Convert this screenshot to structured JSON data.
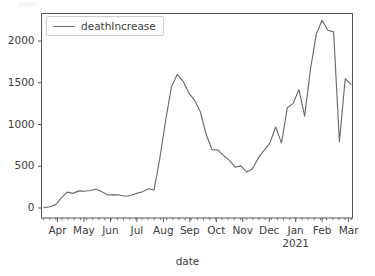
{
  "figure": {
    "background_color": "#ffffff",
    "line_color": "#6b6b6b",
    "axis_color": "#555555",
    "text_color": "#3c3c3c"
  },
  "legend": {
    "label": "deathIncrease",
    "position": "upper left",
    "frame": true
  },
  "axes": {
    "xlabel": "date",
    "ylabel": "",
    "year_annotation": "2021"
  },
  "chart_data": {
    "type": "line",
    "title": "",
    "xlabel": "date",
    "ylabel": "",
    "ylim": [
      -120,
      2330
    ],
    "yticks": [
      0,
      500,
      1000,
      1500,
      2000
    ],
    "ytick_labels": [
      "0",
      "500",
      "1000",
      "1500",
      "2000"
    ],
    "xtick_labels": [
      "Apr",
      "May",
      "Jun",
      "Jul",
      "Aug",
      "Sep",
      "Oct",
      "Nov",
      "Dec",
      "Jan",
      "Feb",
      "Mar"
    ],
    "xtick_sublabels": {
      "Jan": "2021"
    },
    "grid": false,
    "legend_position": "upper left",
    "series": [
      {
        "name": "deathIncrease",
        "color": "#6b6b6b",
        "x": [
          "2020-03-08",
          "2020-03-15",
          "2020-03-22",
          "2020-03-29",
          "2020-04-05",
          "2020-04-12",
          "2020-04-19",
          "2020-04-26",
          "2020-05-03",
          "2020-05-10",
          "2020-05-17",
          "2020-05-24",
          "2020-05-31",
          "2020-06-07",
          "2020-06-14",
          "2020-06-21",
          "2020-06-28",
          "2020-07-05",
          "2020-07-12",
          "2020-07-19",
          "2020-07-26",
          "2020-08-02",
          "2020-08-09",
          "2020-08-16",
          "2020-08-23",
          "2020-08-30",
          "2020-09-06",
          "2020-09-13",
          "2020-09-20",
          "2020-09-27",
          "2020-10-04",
          "2020-10-11",
          "2020-10-18",
          "2020-10-25",
          "2020-11-01",
          "2020-11-08",
          "2020-11-15",
          "2020-11-22",
          "2020-11-29",
          "2020-12-06",
          "2020-12-13",
          "2020-12-20",
          "2020-12-27",
          "2021-01-03",
          "2021-01-10",
          "2021-01-17",
          "2021-01-24",
          "2021-01-31",
          "2021-02-07",
          "2021-02-14",
          "2021-02-21",
          "2021-02-28"
        ],
        "values": [
          5,
          15,
          40,
          120,
          190,
          175,
          205,
          200,
          210,
          225,
          195,
          155,
          160,
          155,
          140,
          150,
          175,
          195,
          230,
          215,
          600,
          1050,
          1450,
          1600,
          1520,
          1380,
          1290,
          1150,
          880,
          700,
          695,
          630,
          570,
          490,
          505,
          430,
          470,
          600,
          690,
          780,
          970,
          780,
          1200,
          1250,
          1420,
          1100,
          1660,
          2080,
          2250,
          2130,
          2110,
          790
        ],
        "values_tail": [
          1550,
          1480
        ]
      }
    ]
  }
}
